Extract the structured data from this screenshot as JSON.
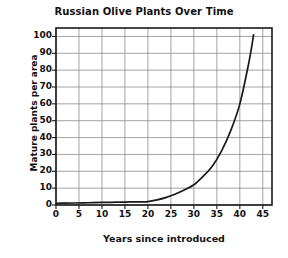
{
  "chart_data": {
    "type": "line",
    "title": "Russian Olive Plants Over Time",
    "xlabel": "Years since introduced",
    "ylabel": "Mature plants per area",
    "xlim": [
      0,
      47
    ],
    "ylim": [
      0,
      105
    ],
    "xticks": [
      0,
      5,
      10,
      15,
      20,
      25,
      30,
      35,
      40,
      45
    ],
    "yticks": [
      0,
      10,
      20,
      30,
      40,
      50,
      60,
      70,
      80,
      90,
      100
    ],
    "xtick_labels": [
      "0",
      "5",
      "10",
      "15",
      "20",
      "25",
      "30",
      "35",
      "40",
      "45"
    ],
    "ytick_labels": [
      "0",
      "10",
      "20",
      "30",
      "40",
      "50",
      "60",
      "70",
      "80",
      "90",
      "100"
    ],
    "grid": true,
    "legend": false,
    "series": [
      {
        "name": "Mature plants per area",
        "color": "#1a1a1a",
        "x": [
          0,
          2,
          4,
          6,
          8,
          10,
          12,
          14,
          16,
          18,
          20,
          22,
          24,
          26,
          28,
          30,
          32,
          34,
          36,
          38,
          40,
          42,
          43
        ],
        "y": [
          1,
          1.1,
          1.2,
          1.3,
          1.4,
          1.5,
          1.6,
          1.7,
          1.8,
          1.9,
          2,
          3,
          4.5,
          6.5,
          9,
          12,
          17,
          23,
          32,
          44,
          60,
          85,
          101
        ]
      }
    ]
  },
  "colors": {
    "axis": "#1a1a1a",
    "grid": "#8a8a8a",
    "curve": "#1a1a1a",
    "background": "#ffffff",
    "text": "#111111"
  },
  "geometry": {
    "plot_left": 56,
    "plot_right": 272,
    "plot_top": 28,
    "plot_bottom": 205
  }
}
